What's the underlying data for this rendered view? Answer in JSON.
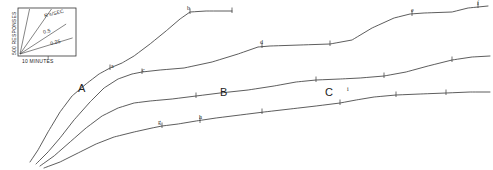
{
  "figure": {
    "type": "cumulative-response-record",
    "background": "#ffffff",
    "ink": "#333333",
    "width": 493,
    "height": 170
  },
  "legend": {
    "name": "rate-calibration-box",
    "box": {
      "x": 18,
      "y": 8,
      "w": 58,
      "h": 48
    },
    "y_axis_label": "500 RESPONSES",
    "x_axis_label": "10 MINUTES",
    "rate_unit_label": "R's/SEC",
    "rate_labels": [
      "0.5",
      "0.25"
    ],
    "fan_lines": [
      {
        "label": "",
        "angle_deg": 78
      },
      {
        "label": "R's/SEC",
        "angle_deg": 55
      },
      {
        "label": "0.5",
        "angle_deg": 33
      },
      {
        "label": "0.25",
        "angle_deg": 17
      }
    ]
  },
  "group_labels": [
    {
      "text": "A",
      "x": 78,
      "y": 88
    },
    {
      "text": "B",
      "x": 220,
      "y": 92
    },
    {
      "text": "C",
      "x": 325,
      "y": 92
    }
  ],
  "event_labels": [
    {
      "text": "a",
      "x": 112,
      "y": 69
    },
    {
      "text": "b",
      "x": 188,
      "y": 11
    },
    {
      "text": "c",
      "x": 143,
      "y": 73
    },
    {
      "text": "d",
      "x": 261,
      "y": 45
    },
    {
      "text": "e",
      "x": 412,
      "y": 13
    },
    {
      "text": "f",
      "x": 478,
      "y": 3
    },
    {
      "text": "g",
      "x": 159,
      "y": 125
    },
    {
      "text": "h",
      "x": 200,
      "y": 120
    },
    {
      "text": "i",
      "x": 348,
      "y": 92
    }
  ],
  "chart_data": {
    "type": "line",
    "title": "",
    "xlabel": "10 MINUTES",
    "ylabel": "500 RESPONSES",
    "grid": false,
    "legend_position": "top-left-inset",
    "series": [
      {
        "name": "A",
        "comment": "steepest record, breaks at b then flattens",
        "points": [
          [
            30,
            162
          ],
          [
            38,
            150
          ],
          [
            48,
            132
          ],
          [
            60,
            112
          ],
          [
            72,
            96
          ],
          [
            86,
            84
          ],
          [
            99,
            74
          ],
          [
            110,
            68
          ],
          [
            122,
            63
          ],
          [
            134,
            56
          ],
          [
            150,
            44
          ],
          [
            166,
            31
          ],
          [
            180,
            19
          ],
          [
            190,
            12
          ],
          [
            206,
            11
          ],
          [
            232,
            11
          ]
        ],
        "markers": [
          [
            110,
            68
          ],
          [
            190,
            12
          ],
          [
            232,
            11
          ]
        ]
      },
      {
        "name": "B",
        "comment": "intermediate record through c and d, long plateaus",
        "points": [
          [
            36,
            164
          ],
          [
            48,
            152
          ],
          [
            60,
            138
          ],
          [
            74,
            120
          ],
          [
            90,
            102
          ],
          [
            104,
            88
          ],
          [
            118,
            79
          ],
          [
            132,
            74
          ],
          [
            142,
            72
          ],
          [
            160,
            70
          ],
          [
            184,
            68
          ],
          [
            212,
            62
          ],
          [
            238,
            54
          ],
          [
            258,
            47
          ],
          [
            270,
            46
          ],
          [
            300,
            45
          ],
          [
            330,
            44
          ],
          [
            352,
            40
          ],
          [
            372,
            28
          ],
          [
            394,
            18
          ],
          [
            410,
            14
          ],
          [
            424,
            13
          ],
          [
            452,
            12
          ],
          [
            468,
            8
          ],
          [
            488,
            6
          ]
        ],
        "markers": [
          [
            142,
            72
          ],
          [
            262,
            46
          ],
          [
            330,
            44
          ],
          [
            412,
            14
          ],
          [
            478,
            6
          ]
        ]
      },
      {
        "name": "C",
        "comment": "shallow middle record with step at i",
        "points": [
          [
            40,
            166
          ],
          [
            54,
            156
          ],
          [
            70,
            142
          ],
          [
            86,
            128
          ],
          [
            102,
            116
          ],
          [
            118,
            108
          ],
          [
            134,
            103
          ],
          [
            150,
            101
          ],
          [
            172,
            99
          ],
          [
            196,
            96
          ],
          [
            220,
            93
          ],
          [
            248,
            90
          ],
          [
            274,
            86
          ],
          [
            296,
            82
          ],
          [
            316,
            80
          ],
          [
            340,
            79
          ],
          [
            360,
            78
          ],
          [
            384,
            76
          ],
          [
            406,
            72
          ],
          [
            428,
            66
          ],
          [
            452,
            60
          ],
          [
            472,
            57
          ],
          [
            490,
            56
          ]
        ],
        "markers": [
          [
            196,
            96
          ],
          [
            316,
            80
          ],
          [
            384,
            76
          ],
          [
            452,
            60
          ]
        ]
      },
      {
        "name": "D",
        "comment": "lowest record through g and h, nearly flat tail",
        "points": [
          [
            44,
            168
          ],
          [
            60,
            162
          ],
          [
            78,
            153
          ],
          [
            96,
            144
          ],
          [
            114,
            137
          ],
          [
            134,
            132
          ],
          [
            152,
            128
          ],
          [
            162,
            126
          ],
          [
            178,
            124
          ],
          [
            196,
            121
          ],
          [
            216,
            118
          ],
          [
            240,
            115
          ],
          [
            264,
            112
          ],
          [
            290,
            109
          ],
          [
            316,
            106
          ],
          [
            340,
            103
          ],
          [
            356,
            100
          ],
          [
            374,
            97
          ],
          [
            396,
            95
          ],
          [
            420,
            94
          ],
          [
            446,
            93
          ],
          [
            470,
            92
          ],
          [
            490,
            92
          ]
        ],
        "markers": [
          [
            162,
            126
          ],
          [
            200,
            121
          ],
          [
            262,
            112
          ],
          [
            340,
            103
          ],
          [
            396,
            95
          ],
          [
            446,
            93
          ]
        ]
      }
    ]
  }
}
